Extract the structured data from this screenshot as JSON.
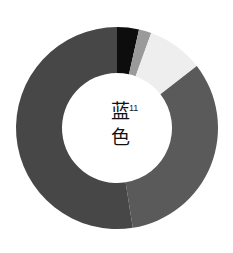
{
  "chart_data": {
    "type": "pie",
    "donut": true,
    "title": "",
    "center_text": [
      "蓝",
      "色"
    ],
    "center_superscript": "11",
    "categories": [
      "black",
      "gray",
      "light",
      "medium",
      "dark"
    ],
    "values": [
      3.5,
      2.0,
      9.0,
      33.0,
      52.5
    ],
    "colors": [
      "#0d0d0d",
      "#9a9a9a",
      "#eeeeee",
      "#5a5a5a",
      "#474747"
    ],
    "start_angle_deg": 0,
    "direction": "clockwise",
    "legend": "none"
  }
}
